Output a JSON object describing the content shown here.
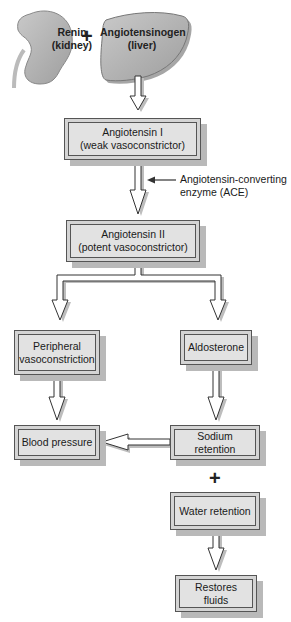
{
  "diagram": {
    "sources": [
      {
        "id": "renin",
        "line1": "Renin",
        "line2": "(kidney)",
        "icon": "kidney-icon"
      },
      {
        "id": "angiotensinogen",
        "line1": "Angiotensinogen",
        "line2": "(liver)",
        "icon": "liver-icon"
      }
    ],
    "operator_plus": "+",
    "nodes": {
      "angiotensin_1": {
        "line1": "Angiotensin I",
        "line2": "(weak vasoconstrictor)"
      },
      "angiotensin_2": {
        "line1": "Angiotensin II",
        "line2": "(potent vasoconstrictor)"
      },
      "peripheral": {
        "line1": "Peripheral",
        "line2": "vasoconstriction"
      },
      "aldosterone": {
        "line1": "Aldosterone"
      },
      "blood_pressure": {
        "line1": "Blood pressure"
      },
      "sodium_retention": {
        "line1": "Sodium retention"
      },
      "water_retention": {
        "line1": "Water retention"
      },
      "restores_fluids": {
        "line1": "Restores fluids"
      }
    },
    "enzyme_label": {
      "line1": "Angiotensin-converting",
      "line2": "enzyme (ACE)"
    },
    "edges": [
      [
        "angiotensinogen",
        "angiotensin_1"
      ],
      [
        "angiotensin_1",
        "angiotensin_2"
      ],
      [
        "angiotensin_2",
        "peripheral"
      ],
      [
        "angiotensin_2",
        "aldosterone"
      ],
      [
        "peripheral",
        "blood_pressure"
      ],
      [
        "aldosterone",
        "sodium_retention"
      ],
      [
        "sodium_retention",
        "blood_pressure"
      ],
      [
        "water_retention",
        "restores_fluids"
      ]
    ],
    "colors": {
      "box_fill": "#e2e2e2",
      "box_shadow": "#b9b9b9",
      "organ_fill": "#b5b5b5",
      "stroke": "#555555"
    }
  }
}
